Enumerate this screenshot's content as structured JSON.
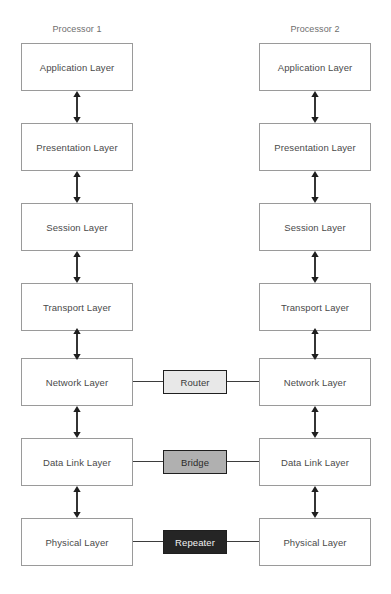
{
  "diagram": {
    "columns": [
      {
        "id": "processor-1",
        "label": "Processor 1"
      },
      {
        "id": "processor-2",
        "label": "Processor 2"
      }
    ],
    "layers": [
      {
        "name": "Application Layer"
      },
      {
        "name": "Presentation Layer"
      },
      {
        "name": "Session Layer"
      },
      {
        "name": "Transport Layer"
      },
      {
        "name": "Network Layer"
      },
      {
        "name": "Data Link Layer"
      },
      {
        "name": "Physical Layer"
      }
    ],
    "devices": [
      {
        "name": "Router",
        "layer": "Network Layer",
        "fill": "#e8e8e8",
        "text_color": "#3a3a3a"
      },
      {
        "name": "Bridge",
        "layer": "Data Link Layer",
        "fill": "#b0b0b0",
        "text_color": "#2a2a2a"
      },
      {
        "name": "Repeater",
        "layer": "Physical Layer",
        "fill": "#252525",
        "text_color": "#f2f2f2"
      }
    ],
    "colors": {
      "box_border": "#9a9a9a",
      "box_fill": "#ffffff",
      "layer_text": "#4a4a4a",
      "title_text": "#6e6e6e",
      "connector": "#1f1f1f",
      "background": "#ffffff"
    }
  }
}
